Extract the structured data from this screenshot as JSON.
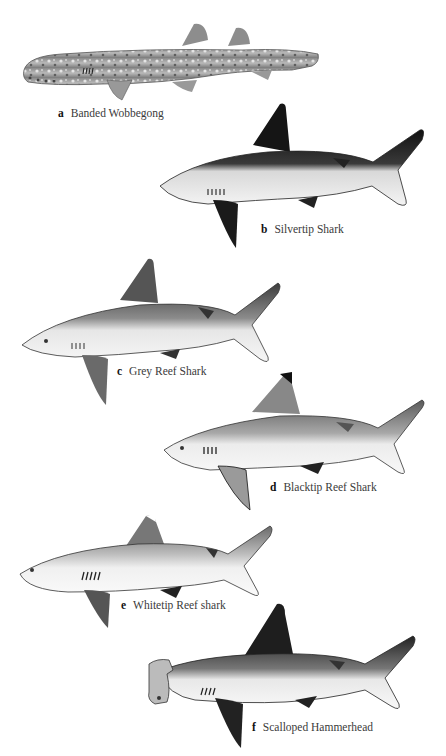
{
  "plate": {
    "background": "#ffffff",
    "species": [
      {
        "letter": "a",
        "name": "Banded Wobbegong",
        "tone": "mottled",
        "icon": "wobbegong-illustration"
      },
      {
        "letter": "b",
        "name": "Silvertip Shark",
        "tone": "dark",
        "icon": "silvertip-shark-illustration"
      },
      {
        "letter": "c",
        "name": "Grey Reef Shark",
        "tone": "grey",
        "icon": "grey-reef-shark-illustration"
      },
      {
        "letter": "d",
        "name": "Blacktip Reef Shark",
        "tone": "grey",
        "icon": "blacktip-reef-shark-illustration"
      },
      {
        "letter": "e",
        "name": "Whitetip Reef shark",
        "tone": "light",
        "icon": "whitetip-reef-shark-illustration"
      },
      {
        "letter": "f",
        "name": "Scalloped Hammerhead",
        "tone": "dark",
        "icon": "scalloped-hammerhead-illustration"
      }
    ]
  }
}
